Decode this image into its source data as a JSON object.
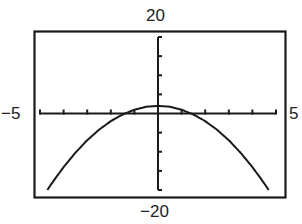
{
  "window": {
    "xmin_label": "−5",
    "xmax_label": "5",
    "ymax_label": "20",
    "ymin_label": "−20"
  },
  "chart_data": {
    "type": "line",
    "title": "",
    "xlabel": "",
    "ylabel": "",
    "xlim": [
      -5,
      5
    ],
    "ylim": [
      -20,
      20
    ],
    "grid": false,
    "legend": null,
    "x_tick_step": 1,
    "y_tick_step": 5,
    "tick_labels": {
      "x_min": "−5",
      "x_max": "5",
      "y_min": "−20",
      "y_max": "20"
    },
    "series": [
      {
        "name": "y = 2 - x^2 (downward parabola)",
        "x": [
          -4.69,
          -4.5,
          -4,
          -3.5,
          -3,
          -2.5,
          -2,
          -1.5,
          -1,
          -0.5,
          0,
          0.5,
          1,
          1.5,
          2,
          2.5,
          3,
          3.5,
          4,
          4.5,
          4.69
        ],
        "values": [
          -20,
          -18.25,
          -14,
          -10.25,
          -7,
          -4.25,
          -2,
          -0.25,
          1,
          1.75,
          2,
          1.75,
          1,
          -0.25,
          -2,
          -4.25,
          -7,
          -10.25,
          -14,
          -18.25,
          -20
        ]
      }
    ],
    "annotations": {
      "vertex": [
        0,
        2
      ],
      "x_intercepts": [
        -1.41,
        1.41
      ]
    }
  }
}
